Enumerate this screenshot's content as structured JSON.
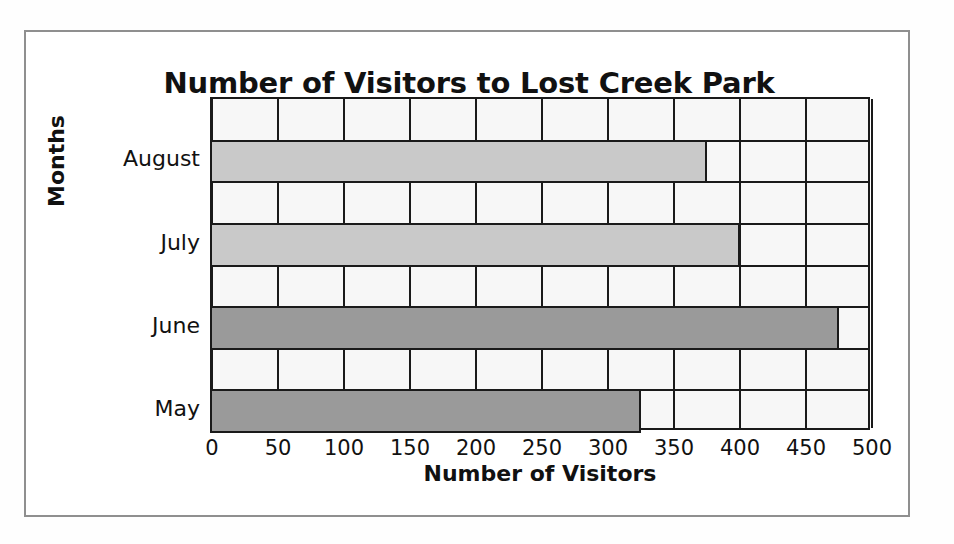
{
  "chart_data": {
    "type": "bar",
    "orientation": "horizontal",
    "title": "Number of Visitors to Lost Creek Park",
    "xlabel": "Number of Visitors",
    "ylabel": "Months",
    "categories": [
      "May",
      "June",
      "July",
      "August"
    ],
    "values": [
      325,
      475,
      400,
      375
    ],
    "xlim": [
      0,
      500
    ],
    "xticks": [
      0,
      50,
      100,
      150,
      200,
      250,
      300,
      350,
      400,
      450,
      500
    ],
    "xtick_labels": [
      "0",
      "50",
      "100",
      "150",
      "200",
      "250",
      "300",
      "350",
      "400",
      "450",
      "500"
    ],
    "bar_colors": [
      "#9a9a9a",
      "#9a9a9a",
      "#c9c9c9",
      "#c9c9c9"
    ],
    "grid": "vertical",
    "legend": "none",
    "plot_background": "#f7f7f7",
    "axis_color": "#1a1a1a",
    "frame_color": "#8f8f8f"
  }
}
